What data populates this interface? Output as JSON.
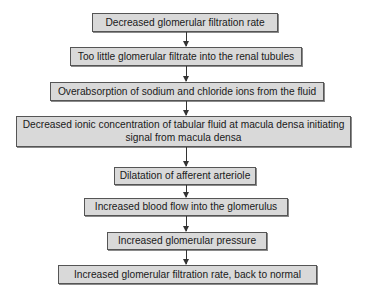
{
  "diagram": {
    "type": "flowchart",
    "direction": "top-to-bottom",
    "nodes": [
      {
        "id": "n1",
        "label": "Decreased glomerular filtration rate"
      },
      {
        "id": "n2",
        "label": "Too little glomerular filtrate into the renal tubules"
      },
      {
        "id": "n3",
        "label": "Overabsorption of sodium and chloride ions from the fluid"
      },
      {
        "id": "n4",
        "label": "Decreased ionic concentration of tabular fluid at macula densa initiating signal from macula densa"
      },
      {
        "id": "n5",
        "label": "Dilatation of afferent arteriole"
      },
      {
        "id": "n6",
        "label": "Increased blood flow into the glomerulus"
      },
      {
        "id": "n7",
        "label": "Increased glomerular pressure"
      },
      {
        "id": "n8",
        "label": "Increased glomerular filtration rate, back to normal"
      }
    ],
    "edges": [
      {
        "from": "n1",
        "to": "n2"
      },
      {
        "from": "n2",
        "to": "n3"
      },
      {
        "from": "n3",
        "to": "n4"
      },
      {
        "from": "n4",
        "to": "n5"
      },
      {
        "from": "n5",
        "to": "n6"
      },
      {
        "from": "n6",
        "to": "n7"
      },
      {
        "from": "n7",
        "to": "n8"
      }
    ],
    "colors": {
      "box_fill": "#d9d9d9",
      "box_border": "#555555",
      "arrow": "#333333",
      "background": "#ffffff"
    }
  }
}
